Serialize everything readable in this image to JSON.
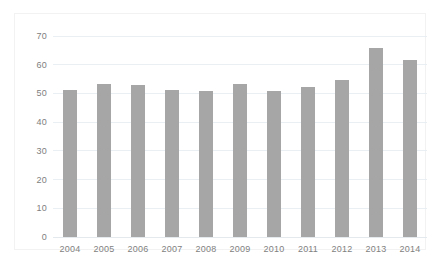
{
  "chart_data": {
    "type": "bar",
    "title": "",
    "subtitle": "",
    "xlabel": "",
    "ylabel": "",
    "categories": [
      "2004",
      "2005",
      "2006",
      "2007",
      "2008",
      "2009",
      "2010",
      "2011",
      "2012",
      "2013",
      "2014"
    ],
    "values": [
      51.3,
      53.4,
      52.8,
      51.3,
      51.0,
      53.4,
      50.7,
      52.3,
      54.7,
      66.0,
      61.6
    ],
    "series": [
      {
        "name": "Series 1",
        "values": [
          51.3,
          53.4,
          52.8,
          51.3,
          51.0,
          53.4,
          50.7,
          52.3,
          54.7,
          66.0,
          61.6
        ]
      }
    ],
    "ylim": [
      0,
      70
    ],
    "yticks": [
      0,
      10,
      20,
      30,
      40,
      50,
      60,
      70
    ],
    "ytick_labels": [
      "0",
      "10",
      "20",
      "30",
      "40",
      "50",
      "60",
      "70"
    ],
    "xtick_labels": [
      "2004",
      "2005",
      "2006",
      "2007",
      "2008",
      "2009",
      "2010",
      "2011",
      "2012",
      "2013",
      "2014"
    ],
    "grid": "horizontal",
    "legend": "none",
    "bar_color": "#a6a6a6",
    "gridline_color": "#eaeff4",
    "tick_label_color": "#808080",
    "background_color": "#ffffff",
    "annotations": []
  }
}
